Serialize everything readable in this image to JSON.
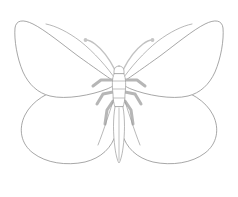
{
  "image": {
    "title": "Butterfly line drawing",
    "subject": "butterfly",
    "style": "minimal outline line art",
    "background_color": "#ffffff",
    "canvas": {
      "width": 238,
      "height": 197
    }
  },
  "palette": {
    "background": "#ffffff",
    "wing_outline": "#8a8a8a",
    "body_outline": "#9a9a9a",
    "body_segment": "#a8a8a8",
    "leg": "#b6b6b6",
    "antenna": "#c2c2c2",
    "antenna_tip": "#c6c6c6",
    "fill": "#ffffff"
  },
  "parts": {
    "forewing_left": {
      "label": "Upper left forewing",
      "outline_color": "#8a8a8a",
      "stroke_width": 0.75,
      "fill": "#ffffff"
    },
    "forewing_right": {
      "label": "Upper right forewing",
      "outline_color": "#8a8a8a",
      "stroke_width": 0.75,
      "fill": "#ffffff"
    },
    "hindwing_left": {
      "label": "Lower left hindwing",
      "outline_color": "#8a8a8a",
      "stroke_width": 0.75,
      "fill": "#ffffff"
    },
    "hindwing_right": {
      "label": "Lower right hindwing",
      "outline_color": "#8a8a8a",
      "stroke_width": 0.75,
      "fill": "#ffffff"
    },
    "head": {
      "label": "Head",
      "outline_color": "#9a9a9a"
    },
    "thorax": {
      "label": "Thorax",
      "outline_color": "#9a9a9a",
      "segment_count": 3
    },
    "abdomen": {
      "label": "Abdomen",
      "outline_color": "#9a9a9a",
      "shape": "narrow elongated tapering"
    },
    "antennae": {
      "label": "Antennae",
      "count": 2,
      "color": "#c2c2c2",
      "stroke_width": 1.5,
      "tip": "clubbed"
    },
    "legs": {
      "label": "Legs",
      "pair_count": 3,
      "total_count": 6,
      "color": "#b6b6b6",
      "stroke_width": 3.0
    }
  },
  "geometry": {
    "center_x": 119,
    "head_y": 68,
    "thorax_top_y": 72,
    "abdomen_tip_y": 163,
    "symmetry": "bilateral about vertical center axis"
  }
}
